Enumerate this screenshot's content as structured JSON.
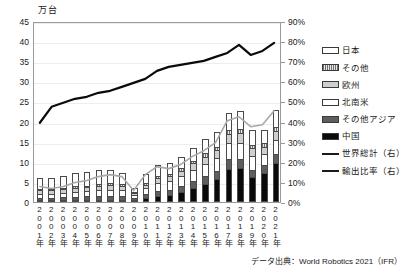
{
  "unit_label": "万台",
  "source_note": "データ出典：World Robotics 2021（IFR）",
  "legend": {
    "items": [
      {
        "label": "日本",
        "key": "japan",
        "kind": "swatch",
        "color": "#ffffff"
      },
      {
        "label": "その他",
        "key": "other",
        "kind": "swatch",
        "color": "#d8d8d8"
      },
      {
        "label": "欧州",
        "key": "europe",
        "kind": "swatch",
        "color": "#cfcfcf"
      },
      {
        "label": "北南米",
        "key": "americas",
        "kind": "swatch",
        "color": "#ffffff"
      },
      {
        "label": "その他アジア",
        "key": "otherasia",
        "kind": "swatch",
        "color": "#5e5e5e"
      },
      {
        "label": "中国",
        "key": "china",
        "kind": "swatch",
        "color": "#0a0a0a"
      },
      {
        "label": "世界総計（右）",
        "key": "worldline",
        "kind": "line",
        "color": "#a8a8a8"
      },
      {
        "label": "輸出比率（右）",
        "key": "exportline",
        "kind": "line",
        "color": "#0a0a0a"
      }
    ]
  },
  "chart_data": {
    "type": "bar",
    "title": "",
    "xlabel": "",
    "ylabel": "万台",
    "y2label": "%",
    "ylim": [
      0,
      45
    ],
    "y2lim": [
      0,
      90
    ],
    "yticks": [
      0,
      5,
      10,
      15,
      20,
      25,
      30,
      35,
      40,
      45
    ],
    "y2ticks": [
      "0%",
      "10%",
      "20%",
      "30%",
      "40%",
      "50%",
      "60%",
      "70%",
      "80%",
      "90%"
    ],
    "grid": true,
    "legend_position": "right",
    "categories": [
      "2001年",
      "2002年",
      "2003年",
      "2004年",
      "2005年",
      "2006年",
      "2007年",
      "2008年",
      "2009年",
      "2010年",
      "2011年",
      "2012年",
      "2013年",
      "2014年",
      "2015年",
      "2016年",
      "2017年",
      "2018年",
      "2019年",
      "2020年",
      "2021年"
    ],
    "stack_order": [
      "china",
      "otherasia",
      "americas",
      "europe",
      "other",
      "japan"
    ],
    "series": [
      {
        "name": "中国",
        "key": "china",
        "axis": "left",
        "values": [
          0.1,
          0.1,
          0.2,
          0.3,
          0.3,
          0.4,
          0.5,
          0.6,
          0.3,
          0.9,
          1.4,
          1.8,
          2.6,
          3.4,
          4.4,
          5.6,
          8.2,
          8.4,
          6.1,
          7.2,
          9.6
        ]
      },
      {
        "name": "その他アジア",
        "key": "otherasia",
        "axis": "left",
        "values": [
          0.6,
          0.6,
          0.7,
          0.8,
          0.9,
          1.0,
          1.0,
          0.9,
          0.5,
          1.1,
          1.4,
          1.3,
          1.5,
          1.9,
          2.0,
          2.1,
          2.6,
          2.4,
          1.9,
          1.9,
          2.4
        ]
      },
      {
        "name": "北南米",
        "key": "americas",
        "axis": "left",
        "values": [
          1.0,
          1.0,
          1.1,
          1.3,
          1.3,
          1.5,
          1.5,
          1.4,
          0.7,
          1.4,
          1.9,
          2.1,
          2.3,
          2.7,
          3.1,
          3.3,
          3.8,
          4.0,
          3.4,
          2.9,
          3.5
        ]
      },
      {
        "name": "欧州",
        "key": "europe",
        "axis": "left",
        "values": [
          0.8,
          0.8,
          0.9,
          1.0,
          1.0,
          1.1,
          1.2,
          1.1,
          0.5,
          0.9,
          1.3,
          1.3,
          1.4,
          1.6,
          1.8,
          1.9,
          2.2,
          2.3,
          2.0,
          1.8,
          2.2
        ]
      },
      {
        "name": "その他",
        "key": "other",
        "axis": "left",
        "values": [
          0.3,
          0.3,
          0.3,
          0.4,
          0.4,
          0.4,
          0.5,
          0.4,
          0.2,
          0.4,
          0.5,
          0.5,
          0.6,
          0.7,
          0.8,
          0.8,
          1.0,
          1.1,
          0.9,
          0.8,
          1.0
        ]
      },
      {
        "name": "日本",
        "key": "japan",
        "axis": "left",
        "values": [
          2.8,
          2.7,
          2.9,
          3.2,
          3.3,
          3.4,
          3.3,
          2.9,
          1.1,
          2.2,
          2.8,
          2.6,
          2.7,
          3.2,
          3.5,
          3.6,
          4.3,
          4.4,
          3.6,
          3.4,
          4.3
        ]
      },
      {
        "name": "世界総計（右）",
        "key": "worldline",
        "axis": "right",
        "type": "line",
        "values": [
          8,
          7,
          8,
          10,
          11,
          13,
          14,
          13,
          6,
          14,
          18,
          17,
          19,
          23,
          26,
          30,
          41,
          43,
          38,
          39,
          46
        ]
      },
      {
        "name": "輸出比率（右）",
        "key": "exportline",
        "axis": "right",
        "type": "line",
        "values": [
          40,
          48,
          50,
          52,
          53,
          55,
          56,
          58,
          60,
          62,
          66,
          68,
          69,
          70,
          71,
          73,
          75,
          79,
          74,
          76,
          80
        ]
      }
    ]
  }
}
